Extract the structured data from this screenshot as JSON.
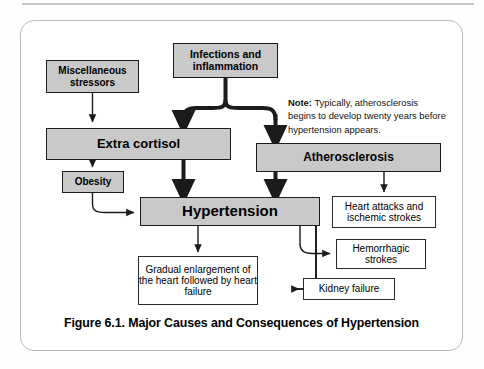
{
  "figure": {
    "caption": "Figure 6.1. Major Causes and Consequences of Hypertension",
    "note_label": "Note:",
    "note_text": " Typically, atherosclerosis begins to develop twenty years before hypertension appears."
  },
  "nodes": {
    "miscellaneous_stressors": {
      "label": "Miscellaneous stressors",
      "style": "gray",
      "x": 46,
      "y": 60,
      "w": 93,
      "h": 33
    },
    "infections_inflammation": {
      "label": "Infections and inflammation",
      "style": "gray",
      "x": 173,
      "y": 43,
      "w": 105,
      "h": 35
    },
    "extra_cortisol": {
      "label": "Extra cortisol",
      "style": "gray",
      "x": 46,
      "y": 128,
      "w": 185,
      "h": 32
    },
    "obesity": {
      "label": "Obesity",
      "style": "gray",
      "x": 62,
      "y": 171,
      "w": 62,
      "h": 22
    },
    "atherosclerosis": {
      "label": "Atherosclerosis",
      "style": "gray",
      "x": 256,
      "y": 143,
      "w": 185,
      "h": 29
    },
    "hypertension": {
      "label": "Hypertension",
      "style": "gray",
      "x": 140,
      "y": 197,
      "w": 180,
      "h": 29
    },
    "heart_attacks": {
      "label": "Heart attacks and ischemic strokes",
      "style": "white",
      "x": 332,
      "y": 196,
      "w": 104,
      "h": 32
    },
    "hemorrhagic_strokes": {
      "label": "Hemorrhagic strokes",
      "style": "white",
      "x": 336,
      "y": 239,
      "w": 90,
      "h": 30
    },
    "kidney_failure": {
      "label": "Kidney failure",
      "style": "white",
      "x": 303,
      "y": 278,
      "w": 92,
      "h": 22
    },
    "gradual_enlargement": {
      "label": "Gradual enlargement of the heart followed by heart failure",
      "style": "white",
      "x": 138,
      "y": 256,
      "w": 120,
      "h": 49
    }
  },
  "edges": [
    {
      "id": "misc-to-cortisol",
      "from": "miscellaneous_stressors",
      "to": "extra_cortisol",
      "weight": "thin"
    },
    {
      "id": "infections-to-cortisol",
      "from": "infections_inflammation",
      "to": "extra_cortisol",
      "weight": "thick"
    },
    {
      "id": "infections-to-atherosclerosis",
      "from": "infections_inflammation",
      "to": "atherosclerosis",
      "weight": "thick"
    },
    {
      "id": "cortisol-to-obesity",
      "from": "extra_cortisol",
      "to": "obesity",
      "weight": "thin"
    },
    {
      "id": "cortisol-to-hypertension",
      "from": "extra_cortisol",
      "to": "hypertension",
      "weight": "thick"
    },
    {
      "id": "obesity-to-hypertension",
      "from": "obesity",
      "to": "hypertension",
      "weight": "thin"
    },
    {
      "id": "atherosclerosis-to-hypertension",
      "from": "atherosclerosis",
      "to": "hypertension",
      "weight": "thick"
    },
    {
      "id": "atherosclerosis-to-heart-attacks",
      "from": "atherosclerosis",
      "to": "heart_attacks",
      "weight": "thin"
    },
    {
      "id": "hypertension-to-gradual",
      "from": "hypertension",
      "to": "gradual_enlargement",
      "weight": "thin"
    },
    {
      "id": "hypertension-to-hemorrhagic",
      "from": "hypertension",
      "to": "hemorrhagic_strokes",
      "weight": "thin"
    },
    {
      "id": "hypertension-to-kidney",
      "from": "hypertension",
      "to": "kidney_failure",
      "weight": "thin"
    }
  ],
  "colors": {
    "node_fill_gray": "#c9c9c9",
    "node_border": "#1b1b1b",
    "node_fill_white": "#ffffff",
    "panel_border": "#b9bbbd",
    "top_rule": "#c5c7c9",
    "text": "#000000"
  }
}
